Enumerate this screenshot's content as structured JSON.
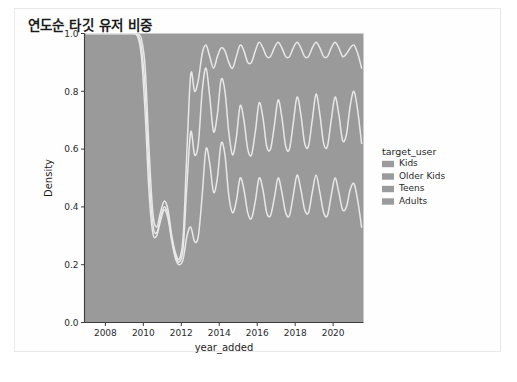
{
  "figure": {
    "title": "연도순 타깃 유저 비중",
    "background_color": "#ffffff",
    "border_color": "#e9e9e9"
  },
  "chart_data": {
    "type": "area",
    "title": "연도순 타깃 유저 비중",
    "subtitle": "",
    "xlabel": "year_added",
    "ylabel": "Density",
    "xlim": [
      2006.9,
      2021.6
    ],
    "ylim": [
      0.0,
      1.0
    ],
    "grid": false,
    "stacked": true,
    "normalized": true,
    "legend": {
      "title": "target_user",
      "position": "right",
      "entries": [
        "Kids",
        "Older Kids",
        "Teens",
        "Adults"
      ]
    },
    "xticks": [
      2008,
      2010,
      2012,
      2014,
      2016,
      2018,
      2020
    ],
    "xtick_labels": [
      "2008",
      "2010",
      "2012",
      "2014",
      "2016",
      "2018",
      "2020"
    ],
    "yticks": [
      0.0,
      0.2,
      0.4,
      0.6,
      0.8,
      1.0
    ],
    "ytick_labels": [
      "0.0",
      "0.2",
      "0.4",
      "0.6",
      "0.8",
      "1.0"
    ],
    "colors": {
      "Kids": "#9b9b9b",
      "Older Kids": "#9b9b9b",
      "Teens": "#9b9b9b",
      "Adults": "#9b9b9b",
      "boundary_line": "#e8e8e8",
      "plot_fill": "#9a9a9a",
      "axis_line": "#3c3c3c"
    },
    "x": [
      2007.0,
      2007.4,
      2007.8,
      2008.2,
      2008.6,
      2009.0,
      2009.4,
      2009.7,
      2009.9,
      2010.1,
      2010.3,
      2010.5,
      2010.7,
      2010.9,
      2011.1,
      2011.3,
      2011.5,
      2011.7,
      2011.9,
      2012.1,
      2012.3,
      2012.5,
      2012.7,
      2012.9,
      2013.1,
      2013.3,
      2013.5,
      2013.7,
      2013.9,
      2014.1,
      2014.3,
      2014.5,
      2014.7,
      2014.9,
      2015.1,
      2015.3,
      2015.5,
      2015.7,
      2015.9,
      2016.1,
      2016.3,
      2016.5,
      2016.7,
      2016.9,
      2017.1,
      2017.3,
      2017.5,
      2017.7,
      2017.9,
      2018.1,
      2018.3,
      2018.5,
      2018.7,
      2018.9,
      2019.1,
      2019.3,
      2019.5,
      2019.7,
      2019.9,
      2020.1,
      2020.3,
      2020.5,
      2020.7,
      2020.9,
      2021.1,
      2021.3,
      2021.5
    ],
    "series": [
      {
        "name": "Kids",
        "description": "cumulative upper boundary of Kids band (bottom-most stacked band)",
        "cum_values": [
          1.0,
          1.0,
          1.0,
          1.0,
          1.0,
          1.0,
          1.0,
          0.99,
          0.92,
          0.72,
          0.45,
          0.31,
          0.3,
          0.35,
          0.39,
          0.36,
          0.28,
          0.22,
          0.2,
          0.22,
          0.3,
          0.33,
          0.28,
          0.3,
          0.44,
          0.6,
          0.55,
          0.45,
          0.5,
          0.62,
          0.58,
          0.44,
          0.38,
          0.42,
          0.5,
          0.46,
          0.38,
          0.36,
          0.42,
          0.5,
          0.46,
          0.38,
          0.37,
          0.43,
          0.5,
          0.45,
          0.38,
          0.37,
          0.44,
          0.51,
          0.46,
          0.39,
          0.38,
          0.45,
          0.51,
          0.45,
          0.38,
          0.37,
          0.44,
          0.5,
          0.45,
          0.39,
          0.4,
          0.46,
          0.48,
          0.42,
          0.33
        ]
      },
      {
        "name": "Older Kids",
        "description": "cumulative upper boundary of Kids + Older Kids",
        "cum_values": [
          1.0,
          1.0,
          1.0,
          1.0,
          1.0,
          1.0,
          1.0,
          0.995,
          0.95,
          0.8,
          0.52,
          0.34,
          0.31,
          0.36,
          0.4,
          0.37,
          0.29,
          0.23,
          0.21,
          0.26,
          0.48,
          0.66,
          0.58,
          0.62,
          0.8,
          0.88,
          0.78,
          0.66,
          0.72,
          0.84,
          0.8,
          0.66,
          0.58,
          0.64,
          0.75,
          0.7,
          0.6,
          0.58,
          0.66,
          0.76,
          0.71,
          0.61,
          0.6,
          0.68,
          0.77,
          0.71,
          0.61,
          0.6,
          0.69,
          0.78,
          0.72,
          0.62,
          0.61,
          0.7,
          0.79,
          0.72,
          0.62,
          0.61,
          0.7,
          0.78,
          0.72,
          0.63,
          0.65,
          0.75,
          0.8,
          0.73,
          0.62
        ]
      },
      {
        "name": "Teens",
        "description": "cumulative upper boundary of Kids + Older Kids + Teens",
        "cum_values": [
          1.0,
          1.0,
          1.0,
          1.0,
          1.0,
          1.0,
          1.0,
          0.998,
          0.98,
          0.88,
          0.6,
          0.38,
          0.33,
          0.38,
          0.42,
          0.39,
          0.3,
          0.24,
          0.22,
          0.3,
          0.6,
          0.86,
          0.8,
          0.84,
          0.93,
          0.96,
          0.92,
          0.88,
          0.92,
          0.95,
          0.94,
          0.9,
          0.88,
          0.92,
          0.96,
          0.94,
          0.9,
          0.9,
          0.94,
          0.97,
          0.95,
          0.92,
          0.92,
          0.95,
          0.97,
          0.95,
          0.92,
          0.92,
          0.95,
          0.97,
          0.95,
          0.92,
          0.92,
          0.95,
          0.97,
          0.95,
          0.92,
          0.92,
          0.95,
          0.97,
          0.95,
          0.92,
          0.93,
          0.95,
          0.96,
          0.93,
          0.88
        ]
      },
      {
        "name": "Adults",
        "description": "top band, cumulative total always 1.0",
        "cum_values": [
          1.0,
          1.0,
          1.0,
          1.0,
          1.0,
          1.0,
          1.0,
          1.0,
          1.0,
          1.0,
          1.0,
          1.0,
          1.0,
          1.0,
          1.0,
          1.0,
          1.0,
          1.0,
          1.0,
          1.0,
          1.0,
          1.0,
          1.0,
          1.0,
          1.0,
          1.0,
          1.0,
          1.0,
          1.0,
          1.0,
          1.0,
          1.0,
          1.0,
          1.0,
          1.0,
          1.0,
          1.0,
          1.0,
          1.0,
          1.0,
          1.0,
          1.0,
          1.0,
          1.0,
          1.0,
          1.0,
          1.0,
          1.0,
          1.0,
          1.0,
          1.0,
          1.0,
          1.0,
          1.0,
          1.0,
          1.0,
          1.0,
          1.0,
          1.0,
          1.0,
          1.0,
          1.0,
          1.0,
          1.0,
          1.0,
          1.0,
          1.0
        ]
      }
    ]
  }
}
